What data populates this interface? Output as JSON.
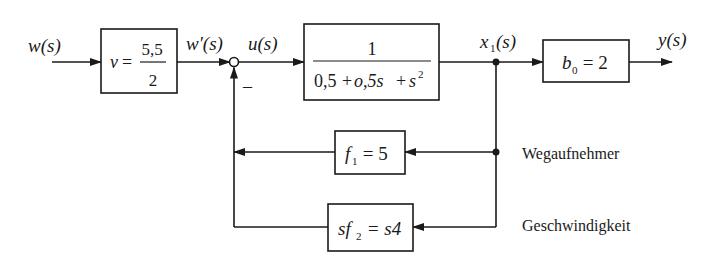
{
  "signals": {
    "input": "w(s)",
    "prefiltered": "w′(s)",
    "control": "u(s)",
    "state": "x",
    "state_sub": "1",
    "state_arg": "(s)",
    "output": "y(s)"
  },
  "blocks": {
    "prefilter": {
      "lhs": "v",
      "eq": "=",
      "num": "5,5",
      "den": "2"
    },
    "plant": {
      "num": "1",
      "den_a": "0,5",
      "den_b": "+",
      "den_c": "o,5s",
      "den_d": "+",
      "den_e": "s",
      "den_exp": "2"
    },
    "output_gain": {
      "sym": "b",
      "sub": "0",
      "rest": " = 2"
    },
    "feedback_position": {
      "sym": "f",
      "sub": "1",
      "rest": " = 5"
    },
    "feedback_velocity": {
      "pre": "sf",
      "sub": "2",
      "rest": " = s4"
    }
  },
  "summing_junction": {
    "sign": "–"
  },
  "annotations": {
    "position_sensor": "Wegaufnehmer",
    "velocity_sensor": "Geschwindigkeit"
  }
}
